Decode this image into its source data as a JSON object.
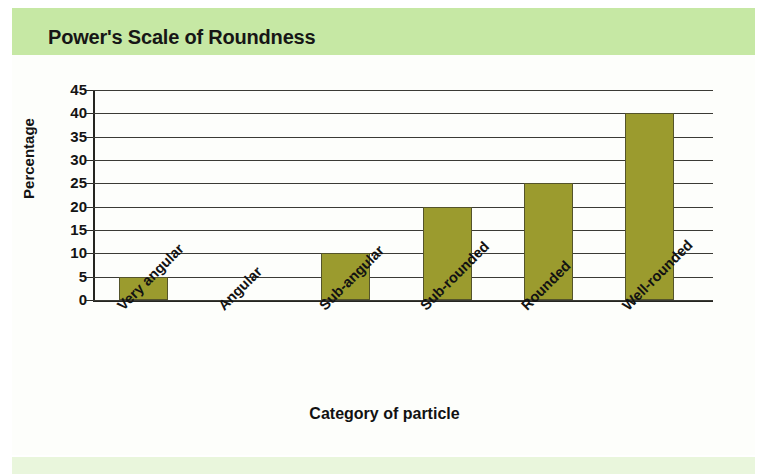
{
  "header": {
    "title": "Power's Scale of Roundness"
  },
  "chart_data": {
    "type": "bar",
    "title": "Power's Scale of Roundness",
    "categories": [
      "Very angular",
      "Angular",
      "Sub-angular",
      "Sub-rounded",
      "Rounded",
      "Well-rounded"
    ],
    "values": [
      5,
      0,
      10,
      20,
      25,
      40
    ],
    "xlabel": "Category of particle",
    "ylabel": "Percentage",
    "ylim": [
      0,
      45
    ],
    "ytick_labels": [
      "45",
      "40",
      "35",
      "30",
      "25",
      "20",
      "15",
      "10",
      "5",
      "0"
    ],
    "ytick_values": [
      45,
      40,
      35,
      30,
      25,
      20,
      15,
      10,
      5,
      0
    ],
    "ytick_step": 5,
    "grid": true,
    "legend": "none",
    "bar_color": "#9b9b2e",
    "bar_edge_color": "#54542a",
    "header_band_color": "#c6e8a4",
    "axis_color": "#252520",
    "grid_color": "#3b3b35",
    "background_color": "#fdfefb"
  }
}
